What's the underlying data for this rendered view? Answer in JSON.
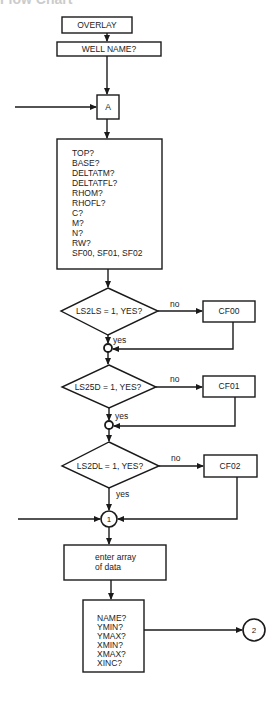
{
  "heading_clipped": "Flow Chart",
  "colors": {
    "line": "#1a1a1a",
    "text": "#222222",
    "background": "#ffffff"
  },
  "flowchart": {
    "start_box": "OVERLAY",
    "well_name_box": "WELL NAME?",
    "connector_a": "A",
    "inputs_box": {
      "lines": [
        "TOP?",
        "BASE?",
        "DELTATM?",
        "DELTATFL?",
        "RHOM?",
        "RHOFL?",
        "C?",
        "M?",
        "N?",
        "RW?",
        "SF00, SF01, SF02"
      ]
    },
    "decisions": [
      {
        "question": "LS2LS = 1, YES?",
        "no_label": "no",
        "yes_label": "yes",
        "no_target": "CF00"
      },
      {
        "question": "LS25D = 1, YES?",
        "no_label": "no",
        "yes_label": "yes",
        "no_target": "CF01"
      },
      {
        "question": "LS2DL = 1, YES?",
        "no_label": "no",
        "yes_label": "yes",
        "no_target": "CF02"
      }
    ],
    "connector_1": "1",
    "enter_array_box": {
      "lines": [
        "enter array",
        "of data"
      ]
    },
    "params_box": {
      "lines": [
        "NAME?",
        "YMIN?",
        "YMAX?",
        "XMIN?",
        "XMAX?",
        "XINC?"
      ]
    },
    "connector_2": "2"
  }
}
